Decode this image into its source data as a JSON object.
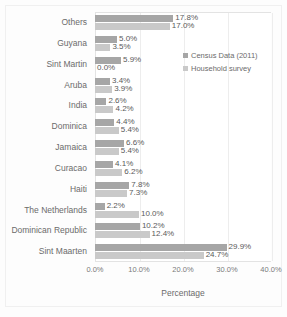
{
  "chart_data": {
    "type": "bar",
    "orientation": "horizontal",
    "title": "",
    "xlabel": "Percentage",
    "ylabel": "",
    "xlim": [
      0,
      40
    ],
    "xticks": [
      "0.0%",
      "10.0%",
      "20.0%",
      "30.0%",
      "40.0%"
    ],
    "xtick_values": [
      0,
      10,
      20,
      30,
      40
    ],
    "grid": true,
    "legend_position": "inside-right-top",
    "categories": [
      "Others",
      "Guyana",
      "Sint Martin",
      "Aruba",
      "India",
      "Dominica",
      "Jamaica",
      "Curacao",
      "Haiti",
      "The Netherlands",
      "Dominican Republic",
      "Sint Maarten"
    ],
    "series": [
      {
        "name": "Census Data (2011)",
        "color": "#a6a6a6",
        "values": [
          17.8,
          5.0,
          5.9,
          3.4,
          2.6,
          4.4,
          6.6,
          4.1,
          7.8,
          2.2,
          10.2,
          29.9
        ],
        "labels": [
          "17.8%",
          "5.0%",
          "5.9%",
          "3.4%",
          "2.6%",
          "4.4%",
          "6.6%",
          "4.1%",
          "7.8%",
          "2.2%",
          "10.2%",
          "29.9%"
        ]
      },
      {
        "name": "Household survey",
        "color": "#c9c9c9",
        "values": [
          17.0,
          3.5,
          0.0,
          3.9,
          4.2,
          5.4,
          5.4,
          6.2,
          7.3,
          10.0,
          12.4,
          24.7
        ],
        "labels": [
          "17.0%",
          "3.5%",
          "0.0%",
          "3.9%",
          "4.2%",
          "5.4%",
          "5.4%",
          "6.2%",
          "7.3%",
          "10.0%",
          "12.4%",
          "24.7%"
        ]
      }
    ]
  }
}
